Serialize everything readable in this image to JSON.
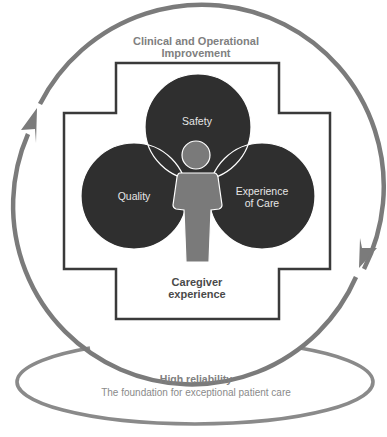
{
  "diagram": {
    "top_label": {
      "line1": "Clinical and Operational",
      "line2": "Improvement"
    },
    "circles": {
      "safety": "Safety",
      "quality": "Quality",
      "experience_line1": "Experience",
      "experience_line2": "of Care"
    },
    "center_label": {
      "line1": "Caregiver",
      "line2": "experience"
    },
    "foundation": {
      "title": "High reliability",
      "subtitle": "The foundation for exceptional patient care"
    },
    "icons": {
      "cycle_arrow_left": "arrow-up-icon",
      "cycle_arrow_right": "arrow-down-icon",
      "person": "person-icon",
      "cross": "medical-cross-icon"
    },
    "colors": {
      "cycle_ring": "#7b7b7b",
      "cross_outline": "#3a3a3a",
      "circle_fill": "#2f2f2f",
      "person_fill": "#7a7a7a",
      "label_gray": "#808080",
      "center_label": "#4a4a4a"
    }
  }
}
